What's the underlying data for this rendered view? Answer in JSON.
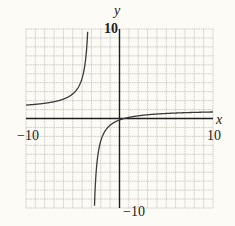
{
  "chart_data": {
    "type": "line",
    "title": "",
    "xlabel": "x",
    "ylabel": "y",
    "xlim": [
      -10,
      10
    ],
    "ylim": [
      -10,
      10
    ],
    "grid": true,
    "grid_step": 1,
    "tick_labels": {
      "x_min": "−10",
      "x_max": "10",
      "y_min": "−10",
      "y_max": "10"
    },
    "series": [
      {
        "name": "rational function",
        "equation": "y = (x - 0.5)/(x + 3)",
        "vertical_asymptote": -3,
        "horizontal_asymptote": 1,
        "sample_points": [
          {
            "x": -10,
            "y": 1.5
          },
          {
            "x": -8,
            "y": 1.7
          },
          {
            "x": -6,
            "y": 2.17
          },
          {
            "x": -5,
            "y": 2.75
          },
          {
            "x": -4,
            "y": 4.5
          },
          {
            "x": -3.5,
            "y": 8.0
          },
          {
            "x": -2.5,
            "y": -6.0
          },
          {
            "x": -2,
            "y": -2.5
          },
          {
            "x": -1,
            "y": -0.75
          },
          {
            "x": 0,
            "y": -0.17
          },
          {
            "x": 0.5,
            "y": 0
          },
          {
            "x": 2,
            "y": 0.3
          },
          {
            "x": 5,
            "y": 0.56
          },
          {
            "x": 10,
            "y": 0.73
          }
        ]
      }
    ],
    "legend": null
  },
  "colors": {
    "background": "#fcfbf6",
    "grid": "#b9b9b4",
    "axis": "#1e1e1e",
    "curve": "#3a3a3a"
  }
}
